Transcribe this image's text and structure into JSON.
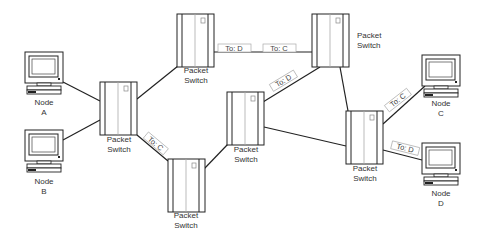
{
  "diagram": {
    "type": "packet-switched-network",
    "nodes": [
      {
        "id": "A",
        "label_line1": "Node",
        "label_line2": "A"
      },
      {
        "id": "B",
        "label_line1": "Node",
        "label_line2": "B"
      },
      {
        "id": "C",
        "label_line1": "Node",
        "label_line2": "C"
      },
      {
        "id": "D",
        "label_line1": "Node",
        "label_line2": "D"
      }
    ],
    "switches": [
      {
        "id": "S1",
        "label_line1": "Packet",
        "label_line2": "Switch"
      },
      {
        "id": "S2",
        "label_line1": "Packet",
        "label_line2": "Switch"
      },
      {
        "id": "S3",
        "label_line1": "Packet",
        "label_line2": "Switch"
      },
      {
        "id": "S4",
        "label_line1": "Packet",
        "label_line2": "Switch"
      },
      {
        "id": "S5",
        "label_line1": "Packet",
        "label_line2": "Switch"
      },
      {
        "id": "S6",
        "label_line1": "Packet",
        "label_line2": "Switch"
      }
    ],
    "packets": [
      {
        "label": "To: C",
        "link": "S1-S5"
      },
      {
        "label": "To: D",
        "link": "S2-S3"
      },
      {
        "label": "To: C",
        "link": "S2-S3"
      },
      {
        "label": "To: D",
        "link": "S4-S3"
      },
      {
        "label": "To: C",
        "link": "S6-C"
      },
      {
        "label": "To: D",
        "link": "S6-D"
      }
    ],
    "links": [
      "A-S1",
      "B-S1",
      "S1-S2",
      "S1-S5",
      "S2-S3",
      "S5-S4",
      "S4-S3",
      "S4-S6",
      "S3-S6",
      "S6-C",
      "S6-D"
    ]
  }
}
